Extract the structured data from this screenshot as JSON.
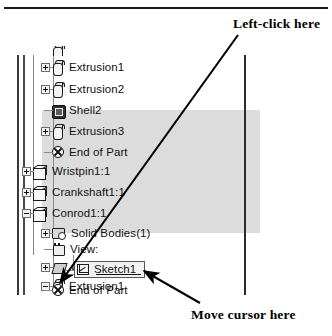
{
  "annotations": {
    "left_click": "Left-click here",
    "move_cursor": "Move cursor here"
  },
  "feature_tree": {
    "panel_name": "feature-manager-design-tree",
    "highlight_color": "#dcdcdc",
    "selected_item": "Sketch1",
    "rows": [
      {
        "label": "Extrusion1",
        "icon": "extrude-icon",
        "indent": 2,
        "expander": "plus",
        "highlighted": true
      },
      {
        "label": "Extrusion2",
        "icon": "extrude-icon",
        "indent": 2,
        "expander": "plus",
        "highlighted": true
      },
      {
        "label": "Shell2",
        "icon": "shell-icon",
        "indent": 2,
        "expander": "none",
        "highlighted": true
      },
      {
        "label": "Extrusion3",
        "icon": "extrude-icon",
        "indent": 2,
        "expander": "plus",
        "highlighted": true
      },
      {
        "label": "End of Part",
        "icon": "end-of-part-icon",
        "indent": 2,
        "expander": "none",
        "highlighted": true
      },
      {
        "label": "Wristpin1:1",
        "icon": "part-icon",
        "indent": 1,
        "expander": "plus",
        "highlighted": true
      },
      {
        "label": "Crankshaft1:1",
        "icon": "part-icon",
        "indent": 1,
        "expander": "plus",
        "highlighted": true
      },
      {
        "label": "Conrod1:1",
        "icon": "part-icon",
        "indent": 1,
        "expander": "minus",
        "highlighted": false
      },
      {
        "label": "Solid Bodies(1)",
        "icon": "solid-bodies-icon",
        "indent": 2,
        "expander": "plus",
        "highlighted": false
      },
      {
        "label": "View:",
        "icon": "view-icon",
        "indent": 2,
        "expander": "none",
        "highlighted": false
      },
      {
        "label": "Origin",
        "icon": "origin-icon",
        "indent": 2,
        "expander": "plus",
        "highlighted": false
      },
      {
        "label": "Extrusion1",
        "icon": "extrude-icon",
        "indent": 2,
        "expander": "minus",
        "highlighted": false
      },
      {
        "label": "Sketch1",
        "icon": "sketch-icon",
        "indent": 3,
        "expander": "none",
        "highlighted": false
      },
      {
        "label": "End of Part",
        "icon": "end-of-part-icon",
        "indent": 2,
        "expander": "none",
        "highlighted": false
      }
    ]
  }
}
